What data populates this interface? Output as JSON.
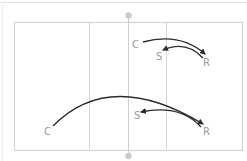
{
  "diagram": {
    "type": "volleyball-court-play",
    "colors": {
      "court_line": "#d4d4d4",
      "net_line": "#cfcfcf",
      "pole": "#cccccc",
      "arrow": "#2b2b2b",
      "label": "#9a9a9a"
    },
    "plays": [
      {
        "labels": {
          "c": "C",
          "s": "S",
          "r": "R"
        }
      },
      {
        "labels": {
          "c": "C",
          "s": "S",
          "r": "R"
        }
      }
    ]
  }
}
